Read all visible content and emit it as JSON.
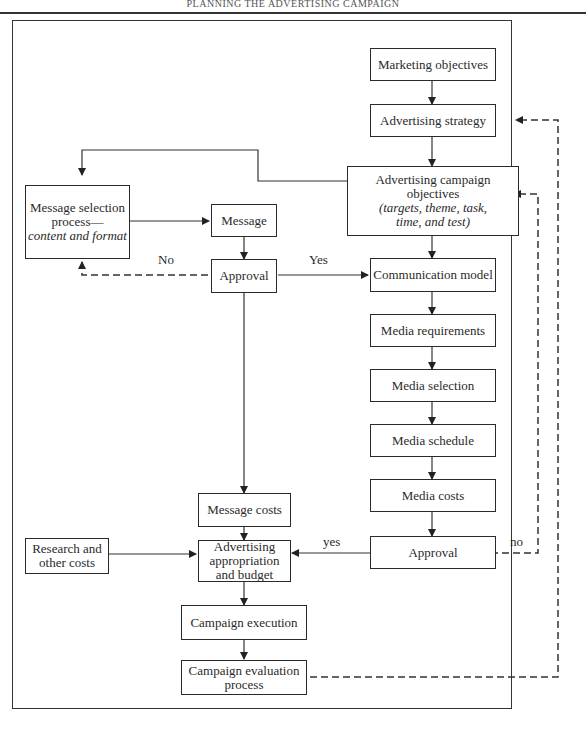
{
  "header": {
    "title": "PLANNING THE ADVERTISING CAMPAIGN"
  },
  "nodes": {
    "marketing_objectives": "Marketing objectives",
    "advertising_strategy": "Advertising strategy",
    "campaign_objectives": {
      "line1": "Advertising campaign objectives",
      "line2": "(targets, theme, task,",
      "line3": "time, and test)"
    },
    "message_selection": {
      "line1": "Message selection",
      "line2": "process—",
      "line3": "content and format"
    },
    "message": "Message",
    "approval_message": "Approval",
    "communication_model": "Communication model",
    "media_requirements": "Media requirements",
    "media_selection": "Media selection",
    "media_schedule": "Media schedule",
    "media_costs": "Media costs",
    "approval_media": "Approval",
    "message_costs": "Message costs",
    "appropriation": {
      "line1": "Advertising",
      "line2": "appropriation",
      "line3": "and budget"
    },
    "research": {
      "line1": "Research and",
      "line2": "other costs"
    },
    "campaign_execution": "Campaign execution",
    "campaign_evaluation": {
      "line1": "Campaign evaluation",
      "line2": "process"
    }
  },
  "edge_labels": {
    "no_upper": "No",
    "yes_upper": "Yes",
    "yes_lower": "yes",
    "no_lower": "no"
  }
}
